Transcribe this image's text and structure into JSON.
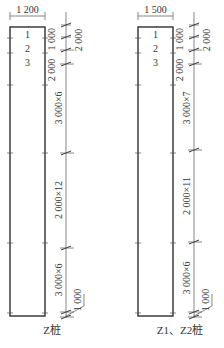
{
  "piles": [
    {
      "width_label": "1 200",
      "segments": [
        "1",
        "2",
        "3"
      ],
      "top_labels": {
        "first": "1 000",
        "second": "2 000",
        "side": "2 000"
      },
      "dims": [
        "3 000×6",
        "2 000×12",
        "3 000×6"
      ],
      "bottom_label": "1 000",
      "caption": "Z桩"
    },
    {
      "width_label": "1 500",
      "segments": [
        "1",
        "2",
        "3"
      ],
      "top_labels": {
        "first": "1 000",
        "second": "2 000",
        "side": "2 000"
      },
      "dims": [
        "3 000×7",
        "2 000×11",
        "3 000×6"
      ],
      "bottom_label": "1 000",
      "caption": "Z1、Z2桩"
    }
  ]
}
